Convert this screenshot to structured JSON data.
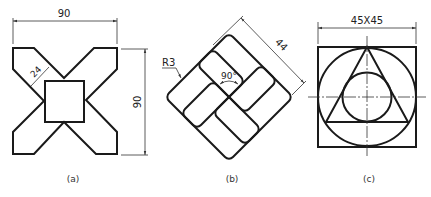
{
  "figures": [
    {
      "id": "a",
      "caption": "(a)",
      "dimensions": {
        "width": "90",
        "height": "90",
        "arm_width": "24"
      }
    },
    {
      "id": "b",
      "caption": "(b)",
      "dimensions": {
        "radius": "R3",
        "angle": "90°",
        "diagonal": "44"
      }
    },
    {
      "id": "c",
      "caption": "(c)",
      "dimensions": {
        "square": "45X45"
      }
    }
  ],
  "colors": {
    "line": "#1a1a1a",
    "background": "#ffffff"
  }
}
